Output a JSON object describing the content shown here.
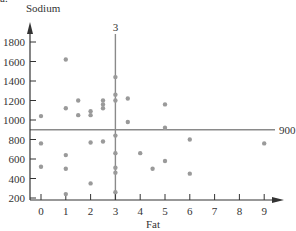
{
  "corner_label": "a.",
  "chart_data": {
    "type": "scatter",
    "title": "",
    "xlabel": "Fat",
    "ylabel": "Sodium",
    "x_ticks": [
      0,
      1,
      2,
      3,
      4,
      5,
      6,
      7,
      8,
      9
    ],
    "y_ticks": [
      200,
      400,
      600,
      800,
      1000,
      1200,
      1400,
      1600,
      1800
    ],
    "xlim": [
      -0.5,
      9.7
    ],
    "ylim": [
      180,
      1950
    ],
    "grid": false,
    "reference_lines": [
      {
        "orientation": "vertical",
        "value": 3,
        "label": "3"
      },
      {
        "orientation": "horizontal",
        "value": 900,
        "label": "900"
      }
    ],
    "points": [
      {
        "x": 0,
        "y": 1040
      },
      {
        "x": 0,
        "y": 760
      },
      {
        "x": 0,
        "y": 520
      },
      {
        "x": 1,
        "y": 1620
      },
      {
        "x": 1,
        "y": 1120
      },
      {
        "x": 1,
        "y": 640
      },
      {
        "x": 1,
        "y": 500
      },
      {
        "x": 1,
        "y": 240
      },
      {
        "x": 1.5,
        "y": 1200
      },
      {
        "x": 1.5,
        "y": 1050
      },
      {
        "x": 2,
        "y": 1090
      },
      {
        "x": 2,
        "y": 1050
      },
      {
        "x": 2,
        "y": 770
      },
      {
        "x": 2,
        "y": 350
      },
      {
        "x": 2.5,
        "y": 1200
      },
      {
        "x": 2.5,
        "y": 1160
      },
      {
        "x": 2.5,
        "y": 1120
      },
      {
        "x": 2.5,
        "y": 780
      },
      {
        "x": 3,
        "y": 1440
      },
      {
        "x": 3,
        "y": 1260
      },
      {
        "x": 3,
        "y": 1200
      },
      {
        "x": 3,
        "y": 840
      },
      {
        "x": 3,
        "y": 660
      },
      {
        "x": 3,
        "y": 510
      },
      {
        "x": 3,
        "y": 460
      },
      {
        "x": 3,
        "y": 260
      },
      {
        "x": 3.5,
        "y": 1220
      },
      {
        "x": 3.5,
        "y": 980
      },
      {
        "x": 4,
        "y": 660
      },
      {
        "x": 4.5,
        "y": 500
      },
      {
        "x": 5,
        "y": 1160
      },
      {
        "x": 5,
        "y": 920
      },
      {
        "x": 5,
        "y": 580
      },
      {
        "x": 6,
        "y": 800
      },
      {
        "x": 6,
        "y": 450
      },
      {
        "x": 9,
        "y": 760
      }
    ],
    "colors": {
      "axis": "#333333",
      "points": "#9a9a9a",
      "reference_line": "#8a8a8a"
    }
  }
}
